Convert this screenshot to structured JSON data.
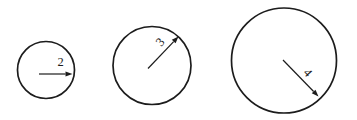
{
  "colors": {
    "background": "#ffffff",
    "ink": "#1c1c1c"
  },
  "figure": {
    "width": 357,
    "height": 120,
    "stroke_width_circle": 1.7,
    "stroke_width_arrow": 1.2,
    "label_font_size": 12.5,
    "arrow_head_length": 7,
    "arrow_head_half_width": 2.6,
    "circles": [
      {
        "name": "circle-radius-2",
        "radius_label": "2",
        "cx": 46,
        "cy": 70,
        "r": 28.5,
        "arrow": {
          "x1": 39,
          "y1": 74,
          "x2": 72.5,
          "y2": 74
        },
        "label": {
          "cx": 60.5,
          "cy": 62,
          "rotate": 0
        }
      },
      {
        "name": "circle-radius-3",
        "radius_label": "3",
        "cx": 152,
        "cy": 65.5,
        "r": 39,
        "arrow": {
          "x1": 148,
          "y1": 68.5,
          "x2": 178.5,
          "y2": 36.5
        },
        "label": {
          "cx": 160,
          "cy": 42,
          "rotate": -50
        }
      },
      {
        "name": "circle-radius-4",
        "radius_label": "4",
        "cx": 284,
        "cy": 60.5,
        "r": 52.5,
        "arrow": {
          "x1": 283,
          "y1": 60,
          "x2": 318.5,
          "y2": 96.5
        },
        "label": {
          "cx": 308,
          "cy": 72.5,
          "rotate": 48
        }
      }
    ]
  }
}
